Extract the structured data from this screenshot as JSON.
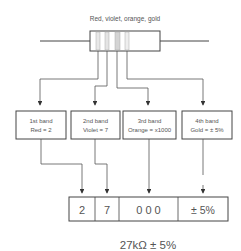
{
  "title": "Red, violet, orange, gold",
  "bands": [
    {
      "label": "1st band",
      "value": "Red = 2"
    },
    {
      "label": "2nd band",
      "value": "Violet = 7"
    },
    {
      "label": "3rd band",
      "value": "Orange = x1000"
    },
    {
      "label": "4th band",
      "value": "Gold = ± 5%"
    }
  ],
  "result_cells": [
    "2",
    "7",
    "0 0 0",
    "± 5%"
  ],
  "result": "27kΩ ± 5%"
}
